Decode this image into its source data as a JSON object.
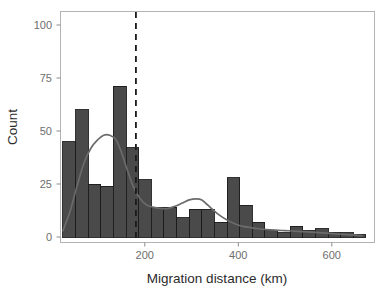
{
  "chart_data": {
    "type": "bar",
    "title": "",
    "subtitle": "",
    "xlabel": "Migration distance (km)",
    "ylabel": "Count",
    "xlim": [
      25,
      670
    ],
    "ylim": [
      0,
      105
    ],
    "xticks": [
      200,
      400,
      600
    ],
    "xtick_labels": [
      "200",
      "400",
      "600"
    ],
    "yticks": [
      0,
      25,
      50,
      75,
      100
    ],
    "ytick_labels": [
      "0",
      "25",
      "50",
      "75",
      "100"
    ],
    "grid": false,
    "legend": null,
    "bin_width": 27,
    "bin_starts": [
      25,
      52,
      79,
      106,
      133,
      160,
      187,
      214,
      241,
      268,
      295,
      322,
      349,
      376,
      403,
      430,
      457,
      484,
      511,
      538,
      565,
      592,
      619,
      646
    ],
    "categories": [
      "25-52",
      "52-79",
      "79-106",
      "106-133",
      "133-160",
      "160-187",
      "187-214",
      "214-241",
      "241-268",
      "268-295",
      "295-322",
      "322-349",
      "349-376",
      "376-403",
      "403-430",
      "430-457",
      "457-484",
      "484-511",
      "511-538",
      "538-565",
      "565-592",
      "592-619",
      "619-646",
      "646-673"
    ],
    "values": [
      45,
      60,
      25,
      24,
      71,
      42,
      27,
      14,
      14,
      9,
      13,
      13,
      7,
      28,
      15,
      7,
      3,
      2,
      5,
      3,
      4,
      2,
      2,
      1
    ],
    "annotations": [
      {
        "name": "mean-line",
        "type": "vertical-dashed-line",
        "x": 181,
        "style": "dashed",
        "color": "#1a1a1a"
      }
    ],
    "overlays": [
      {
        "name": "density-curve",
        "type": "line",
        "color": "#6b6b6b",
        "x": [
          25,
          40,
          55,
          70,
          85,
          100,
          112,
          125,
          138,
          150,
          162,
          175,
          190,
          205,
          220,
          235,
          250,
          265,
          280,
          295,
          310,
          322,
          335,
          350,
          365,
          380,
          395,
          410,
          425,
          440,
          460,
          480,
          500,
          520,
          540,
          565,
          590,
          615,
          640,
          665
        ],
        "y": [
          3,
          12,
          24,
          35,
          42,
          46,
          48,
          48,
          46,
          40,
          32,
          24,
          18,
          15,
          14,
          13.5,
          13.5,
          14.5,
          16,
          17.5,
          18,
          17.5,
          15,
          12,
          9.5,
          7.5,
          6,
          5,
          4.5,
          4,
          3.5,
          3.2,
          3,
          2.8,
          2.5,
          2.2,
          1.8,
          1.4,
          1,
          0.6
        ]
      }
    ]
  },
  "colors": {
    "bar_fill": "#4a4a4a",
    "bar_stroke": "#1c1c1c",
    "curve": "#6b6b6b",
    "vline": "#1a1a1a",
    "panel_border": "#b4b4b4",
    "tick_text": "#6e6e6e",
    "axis_title": "#2b2b2b",
    "background": "#ffffff"
  }
}
